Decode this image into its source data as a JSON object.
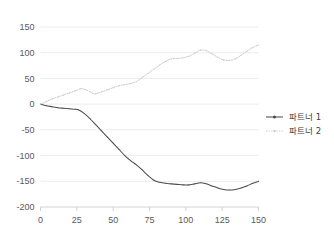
{
  "chart_data": {
    "type": "line",
    "title": "",
    "subtitle": "",
    "xlabel": "",
    "ylabel": "",
    "xlim": [
      0,
      150
    ],
    "ylim": [
      -200,
      150
    ],
    "grid": true,
    "grid_axis": "y",
    "legend_position": "right",
    "x_ticks": [
      0,
      25,
      50,
      75,
      100,
      125,
      150
    ],
    "y_ticks": [
      150,
      100,
      50,
      0,
      -50,
      -100,
      -150,
      -200
    ],
    "x_tick_labels": [
      "0",
      "25",
      "50",
      "75",
      "100",
      "125",
      "150"
    ],
    "y_tick_labels": [
      "150",
      "100",
      "50",
      "0",
      "-50",
      "-100",
      "-150",
      "-200"
    ],
    "series": [
      {
        "name": "파트너 1",
        "style": "solid",
        "color": "#4d4d4f",
        "marker": "small-dot",
        "x": [
          0,
          4,
          8,
          12,
          16,
          20,
          24,
          26,
          30,
          34,
          38,
          42,
          46,
          50,
          54,
          58,
          62,
          66,
          70,
          74,
          78,
          82,
          86,
          90,
          94,
          98,
          102,
          106,
          110,
          114,
          118,
          122,
          126,
          130,
          134,
          138,
          142,
          146,
          150
        ],
        "y": [
          0,
          -3,
          -5,
          -7,
          -8,
          -9,
          -10,
          -11,
          -18,
          -28,
          -40,
          -52,
          -64,
          -76,
          -88,
          -100,
          -110,
          -118,
          -128,
          -139,
          -148,
          -152,
          -154,
          -155,
          -156,
          -157,
          -157,
          -155,
          -153,
          -155,
          -159,
          -163,
          -166,
          -167,
          -166,
          -163,
          -159,
          -154,
          -150
        ]
      },
      {
        "name": "파트너 2",
        "style": "dotted",
        "color": "#c9c9cb",
        "marker": "small-dot",
        "x": [
          0,
          4,
          8,
          12,
          16,
          20,
          24,
          28,
          32,
          36,
          38,
          42,
          46,
          50,
          54,
          58,
          62,
          66,
          70,
          74,
          78,
          82,
          86,
          90,
          94,
          98,
          102,
          106,
          110,
          114,
          118,
          122,
          126,
          130,
          134,
          138,
          142,
          146,
          150
        ],
        "y": [
          0,
          5,
          10,
          14,
          18,
          22,
          26,
          30,
          27,
          21,
          20,
          24,
          28,
          32,
          36,
          38,
          40,
          44,
          52,
          60,
          68,
          76,
          83,
          88,
          89,
          90,
          93,
          99,
          105,
          104,
          98,
          91,
          86,
          85,
          88,
          95,
          103,
          110,
          115
        ]
      }
    ]
  },
  "legend": {
    "items": [
      {
        "label": "파트너 1",
        "style": "solid",
        "color": "#4d4d4f"
      },
      {
        "label": "파트너 2",
        "style": "dotted",
        "color": "#c9c9cb"
      }
    ]
  },
  "colors": {
    "background": "#ffffff",
    "grid": "#ececee",
    "axis": "#d2d2d4",
    "tick_text": "#59595b",
    "legend_text": "#3c3c3e",
    "series1": "#4d4d4f",
    "series2": "#c9c9cb"
  }
}
